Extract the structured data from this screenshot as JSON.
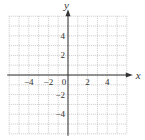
{
  "chart_data": {
    "type": "scatter",
    "title": "",
    "xlabel": "x",
    "ylabel": "y",
    "xlim": [
      -6,
      6
    ],
    "ylim": [
      -6,
      6
    ],
    "grid": true,
    "grid_step": 1,
    "x_ticks": [
      -4,
      -2,
      0,
      2,
      4
    ],
    "x_tick_labels": [
      "−4",
      "−2",
      "0",
      "2",
      "4"
    ],
    "y_ticks": [
      4,
      2,
      -2,
      -4
    ],
    "y_tick_labels": [
      "4",
      "2",
      "−2",
      "−4"
    ],
    "series": [],
    "legend": null
  },
  "colors": {
    "grid": "#bdbdbd",
    "axis": "#333333",
    "text": "#333333"
  }
}
